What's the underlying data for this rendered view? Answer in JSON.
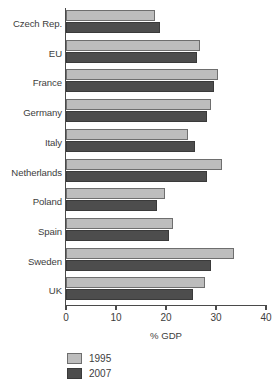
{
  "chart_data": {
    "type": "bar",
    "orientation": "horizontal",
    "title": "",
    "xlabel": "% GDP",
    "ylabel": "",
    "xlim": [
      0,
      40
    ],
    "xticks": [
      "0",
      "10",
      "20",
      "30",
      "40"
    ],
    "grid": false,
    "legend_position": "bottom-left",
    "categories": [
      "Czech Rep.",
      "EU",
      "France",
      "Germany",
      "Italy",
      "Netherlands",
      "Poland",
      "Spain",
      "Sweden",
      "UK"
    ],
    "series": [
      {
        "name": "1995",
        "color": "#bdbdbd",
        "values": [
          17.8,
          26.8,
          30.4,
          29.0,
          24.4,
          31.2,
          19.8,
          21.4,
          33.6,
          27.8
        ]
      },
      {
        "name": "2007",
        "color": "#4d4d4d",
        "values": [
          18.8,
          26.2,
          29.6,
          28.2,
          25.8,
          28.2,
          18.2,
          20.6,
          29.0,
          25.4
        ]
      }
    ]
  }
}
